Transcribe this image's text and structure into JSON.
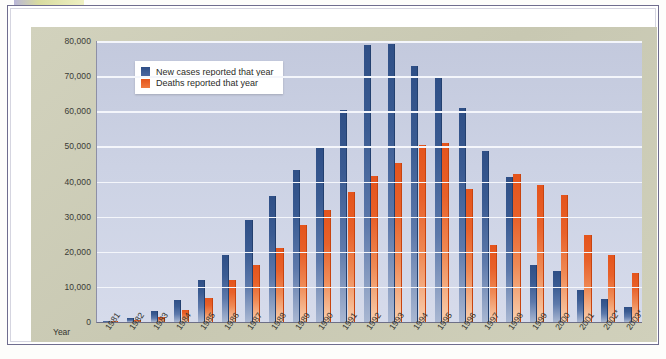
{
  "chart_data": {
    "type": "bar",
    "title": "",
    "xlabel": "Year",
    "ylabel": "",
    "ylim": [
      0,
      80000
    ],
    "ytick_labels": [
      "80,000",
      "70,000",
      "60,000",
      "50,000",
      "40,000",
      "30,000",
      "20,000",
      "10,000",
      "0"
    ],
    "ytick_values": [
      80000,
      70000,
      60000,
      50000,
      40000,
      30000,
      20000,
      10000,
      0
    ],
    "grid": true,
    "legend_position": "top-left",
    "categories": [
      "1981",
      "1982",
      "1983",
      "1984",
      "1985",
      "1986",
      "1987",
      "1988",
      "1989",
      "1990",
      "1991",
      "1992",
      "1993",
      "1994",
      "1995",
      "1996",
      "1997",
      "1998",
      "1999",
      "2000",
      "2001",
      "2002*",
      "2003*"
    ],
    "series": [
      {
        "name": "New cases reported that year",
        "color": "#2f4f86",
        "values": [
          300,
          1100,
          3100,
          6200,
          11900,
          19100,
          29000,
          36000,
          43200,
          49500,
          60300,
          79000,
          79100,
          72800,
          69900,
          60800,
          48600,
          41200,
          16300,
          14600,
          9100,
          6600,
          4200
        ]
      },
      {
        "name": "Deaths reported that year",
        "color": "#e4541c",
        "values": [
          200,
          500,
          1400,
          3500,
          6800,
          12000,
          16200,
          21100,
          27700,
          31800,
          37000,
          41700,
          45300,
          50500,
          51000,
          38000,
          21900,
          42000,
          39000,
          36200,
          24800,
          19000,
          14000
        ]
      }
    ]
  },
  "legend": {
    "items": [
      {
        "label": "New cases reported that year"
      },
      {
        "label": "Deaths reported that year"
      }
    ]
  },
  "axis": {
    "year_label": "Year"
  },
  "colors": {
    "cases": "#2f4f86",
    "deaths": "#e4541c",
    "card": "#cdcdb8",
    "plot": "#ccd2e4",
    "frame": "#6f6d8e",
    "highlight": "#d8dba0"
  }
}
